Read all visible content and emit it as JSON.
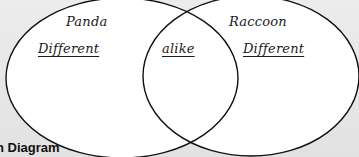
{
  "diagram": {
    "type": "venn",
    "caption": "n Diagram",
    "sets": [
      {
        "name": "Panda",
        "region_label": "Different"
      },
      {
        "name": "Raccoon",
        "region_label": "Different"
      }
    ],
    "intersection_label": "alike"
  },
  "colors": {
    "background": "#e6e6e6",
    "circle_fill": "#ffffff",
    "stroke": "#111111"
  }
}
